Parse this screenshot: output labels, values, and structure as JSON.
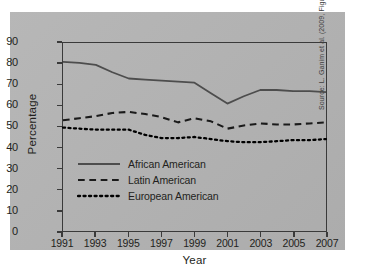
{
  "chart_data": {
    "type": "line",
    "title": "",
    "xlabel": "Year",
    "ylabel": "Percentage",
    "xlim": [
      1991,
      2007
    ],
    "ylim": [
      0,
      90
    ],
    "grid": false,
    "legend_position": "inside-lower-left",
    "x_tick_labels": [
      "1991",
      "1993",
      "1995",
      "1997",
      "1999",
      "2001",
      "2003",
      "2005",
      "2007"
    ],
    "y_tick_labels": [
      "0",
      "10",
      "20",
      "30",
      "40",
      "50",
      "60",
      "70",
      "80",
      "90"
    ],
    "x": [
      1991,
      1992,
      1993,
      1994,
      1995,
      1996,
      1997,
      1998,
      1999,
      2000,
      2001,
      2002,
      2003,
      2004,
      2005,
      2006,
      2007
    ],
    "series": [
      {
        "name": "African American",
        "style": "solid",
        "color": "#4d4d4d",
        "values": [
          81,
          80.5,
          79.5,
          76,
          73,
          72.5,
          72,
          71.5,
          71,
          66,
          61,
          64.5,
          67.5,
          67.5,
          67,
          67,
          66.5
        ]
      },
      {
        "name": "Latin American",
        "style": "dashed",
        "color": "#1a1a1a",
        "values": [
          53,
          54,
          55,
          56.5,
          57,
          56,
          54.5,
          52,
          54,
          52.5,
          49,
          50.5,
          51.5,
          51,
          51,
          51.5,
          52
        ]
      },
      {
        "name": "European American",
        "style": "dotted",
        "color": "#000000",
        "values": [
          49.5,
          49,
          48.5,
          48.5,
          48.5,
          46,
          44.5,
          44.5,
          45,
          44,
          43,
          42.5,
          42.5,
          43,
          43.5,
          43.5,
          44
        ]
      }
    ]
  },
  "axis": {
    "ylabel": "Percentage",
    "xlabel": "Year"
  },
  "legend": {
    "items": [
      {
        "label": "African American",
        "style": "solid"
      },
      {
        "label": "Latin American",
        "style": "dashed"
      },
      {
        "label": "European American",
        "style": "dotted"
      }
    ]
  },
  "credit": {
    "text": "Source: L. Ganim et al. (2009, Figure 2)"
  },
  "colors": {
    "panel_background": "#b3b3b3",
    "page_background": "#ffffff",
    "axis": "#3a3a3a",
    "text": "#231f20"
  }
}
